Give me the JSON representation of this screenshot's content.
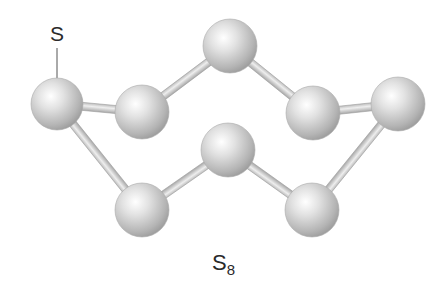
{
  "diagram": {
    "atom_label": "S",
    "formula": {
      "base": "S",
      "subscript": "8"
    },
    "element": "sulfur",
    "atom_color": "#c4c4c4",
    "bond_color": "#d0d0d0",
    "atoms": [
      {
        "id": "a1",
        "x": 57,
        "y": 104,
        "r": 26
      },
      {
        "id": "a2",
        "x": 142,
        "y": 112,
        "r": 27
      },
      {
        "id": "a3",
        "x": 230,
        "y": 46,
        "r": 27
      },
      {
        "id": "a4",
        "x": 313,
        "y": 113,
        "r": 27
      },
      {
        "id": "a5",
        "x": 398,
        "y": 104,
        "r": 27
      },
      {
        "id": "a6",
        "x": 312,
        "y": 210,
        "r": 27
      },
      {
        "id": "a7",
        "x": 228,
        "y": 150,
        "r": 27
      },
      {
        "id": "a8",
        "x": 142,
        "y": 210,
        "r": 27
      }
    ],
    "bonds": [
      [
        "a1",
        "a2"
      ],
      [
        "a2",
        "a3"
      ],
      [
        "a3",
        "a4"
      ],
      [
        "a4",
        "a5"
      ],
      [
        "a5",
        "a6"
      ],
      [
        "a6",
        "a7"
      ],
      [
        "a7",
        "a8"
      ],
      [
        "a8",
        "a1"
      ]
    ]
  }
}
